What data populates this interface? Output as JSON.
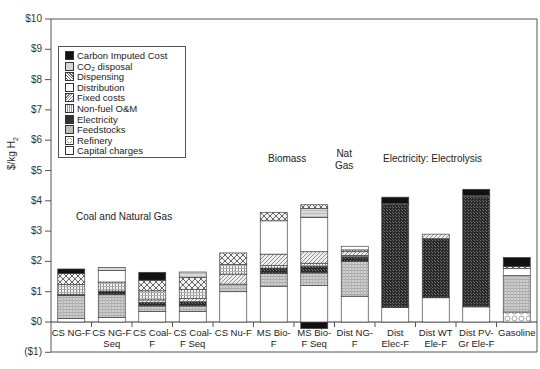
{
  "chart_data": {
    "type": "bar",
    "stacked": true,
    "title": "",
    "xlabel": "",
    "ylabel": "$/kg H2",
    "ylim": [
      -1,
      10
    ],
    "yticks": [
      "($1)",
      "$0",
      "$1",
      "$2",
      "$3",
      "$4",
      "$5",
      "$6",
      "$7",
      "$8",
      "$9",
      "$10"
    ],
    "grid": false,
    "legend_position": "upper-left-inside",
    "categories": [
      "CS NG-F",
      "CS NG-F Seq",
      "CS Coal-F",
      "CS Coal-F Seq",
      "CS Nu-F",
      "MS Bio-F",
      "MS Bio-F Seq",
      "Dist NG-F",
      "Dist Elec-F",
      "Dist WT Ele-F",
      "Dist PV-Gr Ele-F",
      "Gasoline"
    ],
    "category_labels": [
      [
        "CS NG-F",
        ""
      ],
      [
        "CS NG-F",
        "Seq"
      ],
      [
        "CS Coal-",
        "F"
      ],
      [
        "CS Coal-",
        "F Seq"
      ],
      [
        "CS Nu-F",
        ""
      ],
      [
        "MS Bio-",
        "F"
      ],
      [
        "MS Bio-",
        "F Seq"
      ],
      [
        "Dist NG-",
        "F"
      ],
      [
        "Dist",
        "Elec-F"
      ],
      [
        "Dist WT",
        "Ele-F"
      ],
      [
        "Dist PV-",
        "Gr Ele-F"
      ],
      [
        "Gasoline",
        ""
      ]
    ],
    "group_annotations": [
      {
        "text": "Coal and Natural Gas",
        "lines": [
          "Coal and Natural Gas"
        ]
      },
      {
        "text": "Biomass",
        "lines": [
          "Biomass"
        ]
      },
      {
        "text": "Nat Gas",
        "lines": [
          "Nat",
          "Gas"
        ]
      },
      {
        "text": "Electricity: Electrolysis",
        "lines": [
          "Electricity: Electrolysis"
        ]
      }
    ],
    "series": [
      {
        "name": "Capital charges",
        "pattern": "white",
        "values": [
          0.12,
          0.15,
          0.35,
          0.35,
          1.0,
          1.18,
          1.2,
          0.85,
          0.48,
          0.8,
          0.5,
          0.0
        ]
      },
      {
        "name": "Refinery",
        "pattern": "circles",
        "values": [
          0.0,
          0.0,
          0.0,
          0.0,
          0.0,
          0.0,
          0.0,
          0.0,
          0.0,
          0.0,
          0.0,
          0.33
        ]
      },
      {
        "name": "Feedstocks",
        "pattern": "grid",
        "values": [
          0.75,
          0.75,
          0.18,
          0.18,
          0.25,
          0.4,
          0.42,
          1.15,
          0.0,
          0.0,
          0.0,
          1.2
        ]
      },
      {
        "name": "Electricity",
        "pattern": "dark",
        "values": [
          0.03,
          0.12,
          0.12,
          0.12,
          0.0,
          0.18,
          0.2,
          0.15,
          3.4,
          1.95,
          3.65,
          0.0
        ]
      },
      {
        "name": "Non-fuel O&M",
        "pattern": "dots",
        "values": [
          0.0,
          0.0,
          0.08,
          0.12,
          0.0,
          0.05,
          0.08,
          0.05,
          0.0,
          0.0,
          0.0,
          0.0
        ]
      },
      {
        "name": "Fixed costs",
        "pattern": "diagonal",
        "values": [
          0.0,
          0.0,
          0.0,
          0.0,
          0.33,
          0.38,
          0.4,
          0.1,
          0.0,
          0.1,
          0.0,
          0.0
        ]
      },
      {
        "name": "Distribution",
        "pattern": "white",
        "values": [
          0.0,
          0.0,
          0.0,
          0.0,
          0.0,
          1.1,
          1.1,
          0.0,
          0.0,
          0.0,
          0.0,
          0.23
        ]
      },
      {
        "name": "Dispensing",
        "pattern": "crosshatch",
        "values": [
          0.3,
          0.3,
          0.3,
          0.3,
          0.33,
          0.3,
          0.0,
          0.05,
          0.05,
          0.05,
          0.05,
          0.05
        ]
      },
      {
        "name": "CO2 disposal",
        "pattern": "lightgrid",
        "values": [
          0.0,
          0.1,
          0.0,
          0.15,
          0.0,
          0.0,
          0.35,
          0.0,
          0.0,
          0.0,
          0.0,
          0.0
        ]
      },
      {
        "name": "Carbon Imputed Cost",
        "pattern": "black",
        "values": [
          0.15,
          0.0,
          0.25,
          0.0,
          0.0,
          0.0,
          -0.3,
          0.0,
          0.25,
          0.0,
          0.22,
          0.28
        ]
      }
    ],
    "totals": [
      1.75,
      1.8,
      1.62,
      1.65,
      2.28,
      3.62,
      3.87,
      2.5,
      4.12,
      2.9,
      4.38,
      2.13
    ],
    "bar_segments": [
      [
        [
          "Capital charges",
          0.12
        ],
        [
          "Feedstocks",
          0.76
        ],
        [
          "Electricity",
          0.03
        ],
        [
          "Non-fuel O&M",
          0.33
        ],
        [
          "Dispensing",
          0.36
        ],
        [
          "Carbon Imputed Cost",
          0.15
        ]
      ],
      [
        [
          "Capital charges",
          0.15
        ],
        [
          "Feedstocks",
          0.75
        ],
        [
          "Electricity",
          0.12
        ],
        [
          "Non-fuel O&M",
          0.3
        ],
        [
          "Distribution",
          0.38
        ],
        [
          "CO2 disposal",
          0.1
        ]
      ],
      [
        [
          "Capital charges",
          0.35
        ],
        [
          "Feedstocks",
          0.18
        ],
        [
          "Electricity",
          0.12
        ],
        [
          "Fixed costs",
          0.08
        ],
        [
          "Non-fuel O&M",
          0.3
        ],
        [
          "Dispensing",
          0.35
        ],
        [
          "Carbon Imputed Cost",
          0.26
        ]
      ],
      [
        [
          "Capital charges",
          0.35
        ],
        [
          "Feedstocks",
          0.18
        ],
        [
          "Electricity",
          0.14
        ],
        [
          "Fixed costs",
          0.1
        ],
        [
          "Non-fuel O&M",
          0.3
        ],
        [
          "Dispensing",
          0.4
        ],
        [
          "CO2 disposal",
          0.18
        ]
      ],
      [
        [
          "Capital charges",
          1.0
        ],
        [
          "Feedstocks",
          0.25
        ],
        [
          "Fixed costs",
          0.33
        ],
        [
          "Non-fuel O&M",
          0.32
        ],
        [
          "Dispensing",
          0.38
        ]
      ],
      [
        [
          "Capital charges",
          1.18
        ],
        [
          "Feedstocks",
          0.42
        ],
        [
          "Electricity",
          0.18
        ],
        [
          "Non-fuel O&M",
          0.08
        ],
        [
          "Fixed costs",
          0.38
        ],
        [
          "Distribution",
          1.1
        ],
        [
          "Dispensing",
          0.28
        ]
      ],
      [
        [
          "Carbon Imputed Cost",
          -0.22
        ],
        [
          "Capital charges",
          1.2
        ],
        [
          "Feedstocks",
          0.42
        ],
        [
          "Electricity",
          0.22
        ],
        [
          "Non-fuel O&M",
          0.1
        ],
        [
          "Fixed costs",
          0.38
        ],
        [
          "Distribution",
          1.13
        ],
        [
          "CO2 disposal",
          0.3
        ],
        [
          "Dispensing",
          0.12
        ]
      ],
      [
        [
          "Capital charges",
          0.85
        ],
        [
          "Feedstocks",
          1.15
        ],
        [
          "Electricity",
          0.15
        ],
        [
          "Non-fuel O&M",
          0.05
        ],
        [
          "Fixed costs",
          0.12
        ],
        [
          "Dispensing",
          0.06
        ],
        [
          "Distribution",
          0.12
        ]
      ],
      [
        [
          "Capital charges",
          0.48
        ],
        [
          "Electricity",
          3.4
        ],
        [
          "Dispensing",
          0.03
        ],
        [
          "Carbon Imputed Cost",
          0.21
        ]
      ],
      [
        [
          "Capital charges",
          0.8
        ],
        [
          "Electricity",
          1.95
        ],
        [
          "Fixed costs",
          0.15
        ]
      ],
      [
        [
          "Capital charges",
          0.5
        ],
        [
          "Electricity",
          3.65
        ],
        [
          "Dispensing",
          0.03
        ],
        [
          "Carbon Imputed Cost",
          0.2
        ]
      ],
      [
        [
          "Refinery",
          0.33
        ],
        [
          "Feedstocks",
          1.2
        ],
        [
          "Distribution",
          0.23
        ],
        [
          "Dispensing",
          0.07
        ],
        [
          "Carbon Imputed Cost",
          0.3
        ]
      ]
    ]
  },
  "legend": {
    "items": [
      {
        "label": "Carbon Imputed Cost",
        "pattern": "black"
      },
      {
        "label": "CO₂ disposal",
        "pattern": "lightgrid"
      },
      {
        "label": "Dispensing",
        "pattern": "crosshatch"
      },
      {
        "label": "Distribution",
        "pattern": "white"
      },
      {
        "label": "Fixed costs",
        "pattern": "diagonal"
      },
      {
        "label": "Non-fuel O&M",
        "pattern": "dots"
      },
      {
        "label": "Electricity",
        "pattern": "dark"
      },
      {
        "label": "Feedstocks",
        "pattern": "grid"
      },
      {
        "label": "Refinery",
        "pattern": "circles"
      },
      {
        "label": "Capital charges",
        "pattern": "white"
      }
    ]
  },
  "axis": {
    "ylabel": "$/kg H",
    "ylabel_sub": "2"
  },
  "colors": {
    "axis": "#555555",
    "bar_outline": "#444444",
    "black": "#111111",
    "dark": "#2e2e2e",
    "grid_fill": "#c8c8c8",
    "light_fill": "#e6e6e6"
  }
}
